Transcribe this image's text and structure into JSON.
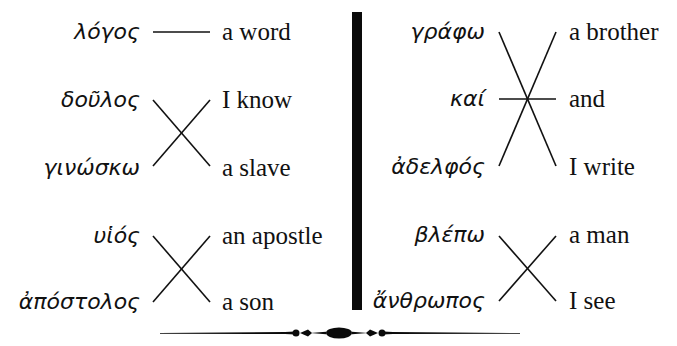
{
  "exercise": {
    "left_column": {
      "greek": [
        "λόγος",
        "δοῦλος",
        "γινώσκω",
        "υἱός",
        "ἀπόστολος"
      ],
      "english": [
        "a word",
        "I know",
        "a slave",
        "an apostle",
        "a son"
      ]
    },
    "right_column": {
      "greek": [
        "γράφω",
        "καί",
        "ἀδελφός",
        "βλέπω",
        "ἄνθρωπος"
      ],
      "english": [
        "a brother",
        "and",
        "I write",
        "a man",
        "I see"
      ]
    },
    "ornament": "decorative-rule"
  }
}
